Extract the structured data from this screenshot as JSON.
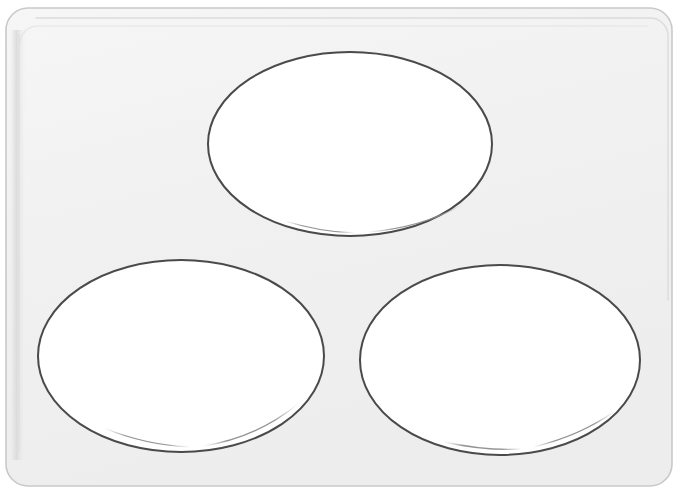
{
  "document": {
    "title": "Oval Label Sheet Template",
    "type": "blank-label-sheet",
    "width": 680,
    "height": 492
  },
  "canvas": {
    "background_color": "#ffffff",
    "sheet_fill_color": "#f2f2f2",
    "sheet_border_color": "#c9c9c9",
    "sheet_inner_line_color": "#dedede",
    "sheet": {
      "x": 6,
      "y": 8,
      "width": 666,
      "height": 478,
      "corner_radius": 22
    },
    "inner_rim": {
      "x": 18,
      "y": 18,
      "width": 650,
      "height": 462,
      "corner_radius": 18
    }
  },
  "labels": {
    "count": 3,
    "shape": "ellipse",
    "fill_color": "#ffffff",
    "stroke_color": "#4a4a4a",
    "stroke_width": 2,
    "highlight_arc_color": "#9a9a9a",
    "items": [
      {
        "name": "label-top-center",
        "position_label": "Top Center",
        "cx": 350,
        "cy": 144,
        "rx": 142,
        "ry": 92,
        "text": ""
      },
      {
        "name": "label-bottom-left",
        "position_label": "Bottom Left",
        "cx": 181,
        "cy": 356,
        "rx": 143,
        "ry": 96,
        "text": ""
      },
      {
        "name": "label-bottom-right",
        "position_label": "Bottom Right",
        "cx": 500,
        "cy": 360,
        "rx": 140,
        "ry": 95,
        "text": ""
      }
    ]
  }
}
